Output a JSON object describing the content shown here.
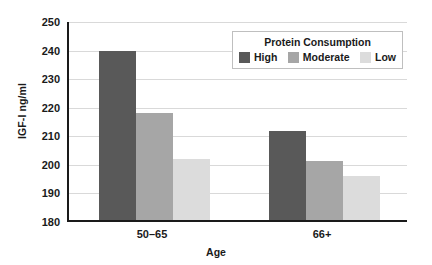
{
  "chart_data": {
    "type": "bar",
    "title": "",
    "xlabel": "Age",
    "ylabel": "IGF-I ng/ml",
    "categories": [
      "50–65",
      "66+"
    ],
    "series": [
      {
        "name": "High",
        "color": "#595959",
        "values": [
          239,
          211
        ]
      },
      {
        "name": "Moderate",
        "color": "#a6a6a6",
        "values": [
          217.5,
          200.5
        ]
      },
      {
        "name": "Low",
        "color": "#dcdcdc",
        "values": [
          201.5,
          195.5
        ]
      }
    ],
    "ylim": [
      180,
      250
    ],
    "yticks": [
      180,
      190,
      200,
      210,
      220,
      230,
      240,
      250
    ],
    "ytick_labels": [
      "180",
      "190",
      "200",
      "210",
      "220",
      "230",
      "240",
      "250"
    ],
    "grid": "horizontal",
    "legend_position": "top-right",
    "legend_title": "Protein Consumption"
  },
  "legend": {
    "title": "Protein Consumption",
    "entries": [
      {
        "label": "High",
        "color": "#595959"
      },
      {
        "label": "Moderate",
        "color": "#a6a6a6"
      },
      {
        "label": "Low",
        "color": "#dcdcdc"
      }
    ]
  },
  "axes": {
    "y_title": "IGF-I ng/ml",
    "x_title": "Age",
    "y_ticks": [
      "250",
      "240",
      "230",
      "220",
      "210",
      "200",
      "190",
      "180"
    ],
    "x_ticks": [
      "50–65",
      "66+"
    ]
  }
}
